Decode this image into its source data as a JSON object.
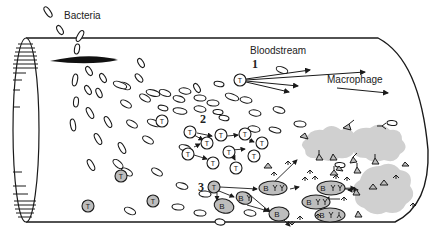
{
  "labels": {
    "bacteria": "Bacteria",
    "bloodstream": "Bloodstream",
    "macrophage": "Macrophage"
  },
  "steps": [
    "1",
    "2",
    "3"
  ],
  "cells": {
    "t_cell_letter": "T",
    "b_cell_letter": "B"
  },
  "colors": {
    "line": "#1a1a1a",
    "cell_fill_gray": "#bdbdbd",
    "cell_fill_white": "#ffffff",
    "infection_cloud": "#d0d0d0",
    "background": "#ffffff"
  },
  "icons": [
    "bacterium-icon",
    "t-cell-icon",
    "b-cell-icon",
    "antibody-icon",
    "macrophage-arrow-icon",
    "infection-cloud-icon"
  ]
}
